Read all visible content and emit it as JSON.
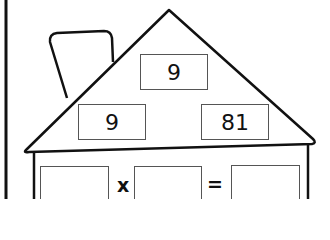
{
  "worksheet": {
    "type": "fact-family-house",
    "roof": {
      "top_number": "9",
      "left_number": "9",
      "right_number": "81"
    },
    "equation": {
      "operand1": "",
      "operator": "x",
      "operand2": "",
      "equals": "=",
      "result": ""
    }
  },
  "colors": {
    "line": "#111111",
    "box_border": "#555555",
    "background": "#ffffff"
  }
}
